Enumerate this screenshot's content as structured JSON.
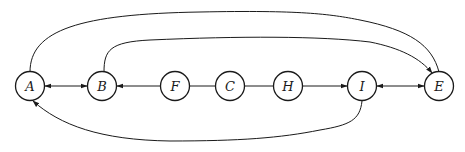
{
  "diagram": {
    "type": "directed-graph",
    "nodes": [
      {
        "id": "A",
        "label": "A",
        "x": 30,
        "y": 86
      },
      {
        "id": "B",
        "label": "B",
        "x": 102,
        "y": 86
      },
      {
        "id": "F",
        "label": "F",
        "x": 175,
        "y": 86
      },
      {
        "id": "C",
        "label": "C",
        "x": 230,
        "y": 86
      },
      {
        "id": "H",
        "label": "H",
        "x": 288,
        "y": 86
      },
      {
        "id": "I",
        "label": "I",
        "x": 362,
        "y": 86
      },
      {
        "id": "E",
        "label": "E",
        "x": 439,
        "y": 86
      }
    ],
    "edges": [
      {
        "from": "A",
        "to": "B",
        "direction": "both"
      },
      {
        "from": "F",
        "to": "B",
        "direction": "forward"
      },
      {
        "from": "F",
        "to": "C",
        "direction": "none"
      },
      {
        "from": "C",
        "to": "H",
        "direction": "none"
      },
      {
        "from": "H",
        "to": "I",
        "direction": "forward"
      },
      {
        "from": "I",
        "to": "E",
        "direction": "both"
      },
      {
        "from": "A",
        "to": "E",
        "direction": "none",
        "route": "arc-top-outer"
      },
      {
        "from": "B",
        "to": "E",
        "direction": "forward",
        "route": "arc-top-inner"
      },
      {
        "from": "I",
        "to": "A",
        "direction": "forward",
        "route": "arc-bottom"
      }
    ]
  }
}
